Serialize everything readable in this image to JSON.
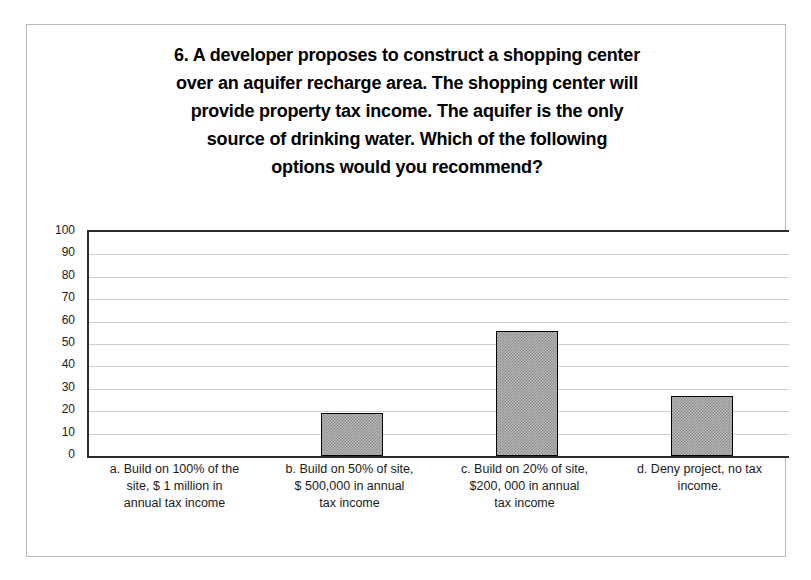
{
  "chart_data": {
    "type": "bar",
    "title_lines": [
      "6. A developer proposes to construct a shopping center",
      "over an aquifer recharge area.  The shopping center will",
      "provide property tax income.  The aquifer is the only",
      "source of drinking water.  Which of the following",
      "options would you recommend?"
    ],
    "categories": [
      "a. Build on 100% of the site, $ 1 million in annual tax income",
      "b. Build on 50% of site, $ 500,000 in annual tax income",
      "c. Build on 20% of site, $200, 000 in annual tax income",
      "d. Deny project, no tax income."
    ],
    "category_lines": [
      [
        "a. Build on 100% of the",
        "site, $ 1 million in",
        "annual tax income"
      ],
      [
        "b. Build on 50% of site,",
        "$ 500,000 in annual",
        "tax income"
      ],
      [
        "c. Build on 20% of site,",
        "$200, 000 in annual",
        "tax income"
      ],
      [
        "d. Deny project, no tax",
        "income."
      ]
    ],
    "values": [
      0,
      19,
      56,
      27
    ],
    "xlabel": "",
    "ylabel": "",
    "ylim": [
      0,
      100
    ],
    "ytick_labels": [
      "100",
      "90",
      "80",
      "70",
      "60",
      "50",
      "40",
      "30",
      "20",
      "10",
      "0"
    ],
    "ytick_values": [
      100,
      90,
      80,
      70,
      60,
      50,
      40,
      30,
      20,
      10,
      0
    ],
    "grid": true,
    "legend": false,
    "colors": {
      "bar_fill": "#b6b6b6",
      "bar_border": "#000000",
      "gridline": "#cfcfcf",
      "axis": "#2b2b2b",
      "text": "#1a1a1a",
      "title": "#000000",
      "frame_border": "#b9b9b9",
      "background": "#ffffff"
    }
  }
}
